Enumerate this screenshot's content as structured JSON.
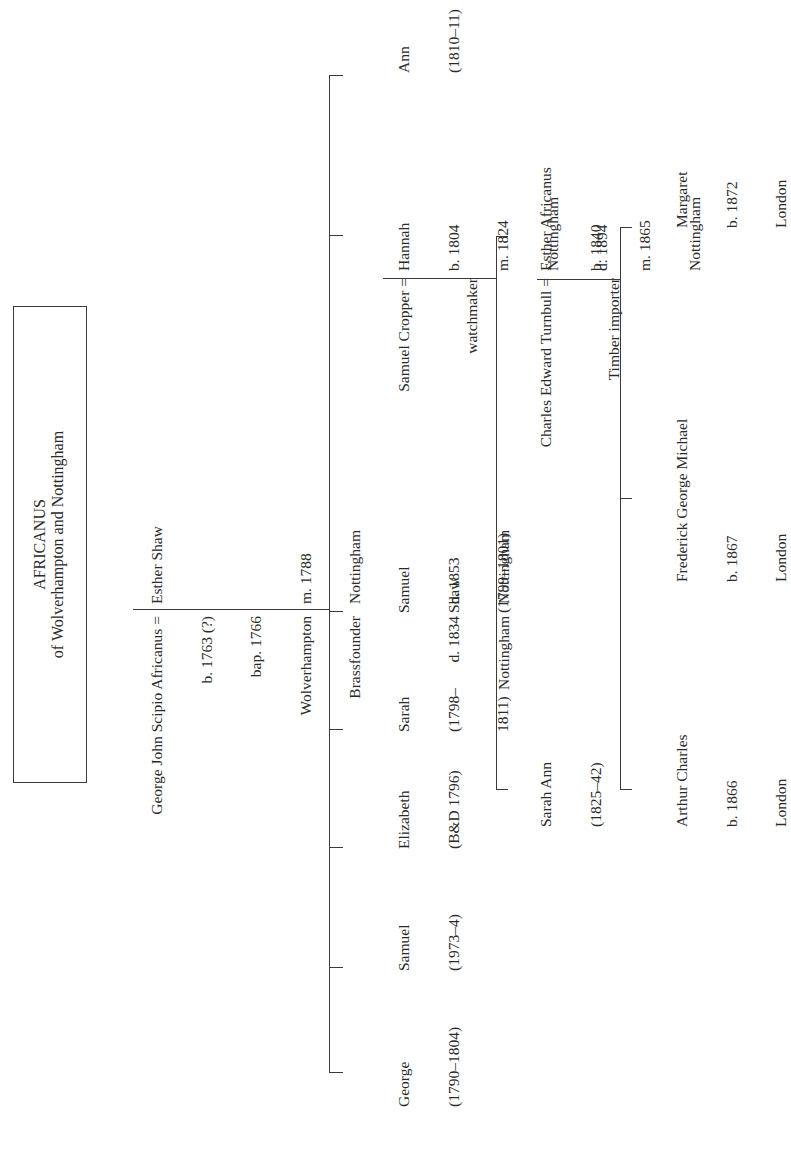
{
  "title": {
    "name": "AFRICANUS",
    "subtitle": "of Wolverhampton and Nottingham"
  },
  "generation1": {
    "husband": {
      "name": "George John Scipio Africanus =",
      "details": [
        "b. 1763 (?)",
        "bap. 1766",
        "Wolverhampton",
        "Brassfounder",
        "",
        "d. 1834",
        "Nottingham"
      ]
    },
    "wife": {
      "name": "Esther Shaw",
      "details": [
        "",
        "",
        "m. 1788",
        "Nottingham",
        "",
        "d. 1853",
        "Nottingham"
      ]
    }
  },
  "children": [
    {
      "name": "George",
      "lines": [
        "(1790–1804)"
      ]
    },
    {
      "name": "Samuel",
      "lines": [
        "(1973–4)"
      ]
    },
    {
      "name": "Elizabeth",
      "lines": [
        "(B&D 1796)"
      ]
    },
    {
      "name": "Sarah",
      "lines": [
        "(1798–",
        "1811)"
      ]
    },
    {
      "name": "Samuel",
      "lines": [
        "Shaw",
        "(1799–1801)"
      ]
    },
    {
      "name": "Hannah",
      "lines": [
        "b. 1804",
        "m. 1824",
        "Nottingham",
        "d. 1894"
      ]
    },
    {
      "name": "Ann",
      "lines": [
        "(1810–11)"
      ]
    }
  ],
  "generation2_spouse": {
    "name": "Samuel Cropper =",
    "occupation": "watchmaker"
  },
  "grandchildren": [
    {
      "name": "Sarah Ann",
      "lines": [
        "(1825–42)"
      ]
    },
    {
      "name": "Esther Africanus",
      "lines": [
        "b. 1840",
        "m. 1865",
        "Nottingham"
      ]
    }
  ],
  "generation3_spouse": {
    "name": "Charles Edward Turnbull =",
    "occupation": "Timber importer"
  },
  "great_grandchildren": [
    {
      "name": "Arthur Charles",
      "lines": [
        "b. 1866",
        "London"
      ]
    },
    {
      "name": "Frederick George Michael",
      "lines": [
        "b. 1867",
        "London"
      ]
    },
    {
      "name": "Margaret",
      "lines": [
        "b. 1872",
        "London"
      ]
    }
  ],
  "colors": {
    "line": "#3a3a3a",
    "text": "#2a2a2a",
    "background": "#ffffff"
  }
}
